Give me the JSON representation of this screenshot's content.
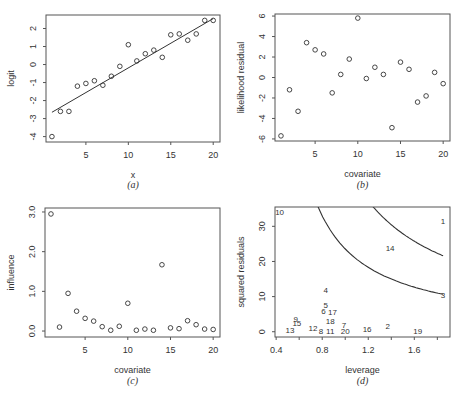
{
  "chart_data": [
    {
      "panel": "a",
      "type": "scatter",
      "caption": "(a)",
      "xlabel": "x",
      "ylabel": "logit",
      "xlim": [
        0.3,
        20.8
      ],
      "ylim": [
        -4.3,
        2.75
      ],
      "xticks": [
        5,
        10,
        15,
        20
      ],
      "yticks": [
        -4,
        -3,
        -2,
        -1,
        0,
        1,
        2
      ],
      "grid": false,
      "x": [
        1,
        2,
        3,
        4,
        5,
        6,
        7,
        8,
        9,
        10,
        11,
        12,
        13,
        14,
        15,
        16,
        17,
        18,
        19,
        20
      ],
      "y": [
        -4.0,
        -2.6,
        -2.6,
        -1.2,
        -1.05,
        -0.9,
        -1.15,
        -0.65,
        -0.1,
        1.1,
        0.2,
        0.6,
        0.8,
        0.4,
        1.65,
        1.7,
        1.35,
        1.7,
        2.45,
        2.45
      ],
      "fit_line": {
        "x": [
          1,
          20
        ],
        "y": [
          -2.65,
          2.55
        ]
      }
    },
    {
      "panel": "b",
      "type": "scatter",
      "caption": "(b)",
      "xlabel": "covariate",
      "ylabel": "likelihood residual",
      "xlim": [
        0.3,
        20.8
      ],
      "ylim": [
        -6.2,
        6.2
      ],
      "xticks": [
        5,
        10,
        15,
        20
      ],
      "yticks": [
        -6,
        -4,
        -2,
        0,
        2,
        4,
        6
      ],
      "grid": false,
      "x": [
        1,
        2,
        3,
        4,
        5,
        6,
        7,
        8,
        9,
        10,
        11,
        12,
        13,
        14,
        15,
        16,
        17,
        18,
        19,
        20
      ],
      "y": [
        -5.7,
        -1.2,
        -3.3,
        3.4,
        2.7,
        2.3,
        -1.5,
        0.3,
        1.8,
        5.8,
        -0.1,
        1.0,
        0.3,
        -4.9,
        1.5,
        0.8,
        -2.4,
        -1.8,
        0.5,
        -0.6
      ]
    },
    {
      "panel": "c",
      "type": "scatter",
      "caption": "(c)",
      "xlabel": "covariate",
      "ylabel": "influence",
      "xlim": [
        0.3,
        20.8
      ],
      "ylim": [
        -0.15,
        3.1
      ],
      "xticks": [
        5,
        10,
        15,
        20
      ],
      "yticks": [
        0.0,
        1.0,
        2.0,
        3.0
      ],
      "yticklabels": [
        "0.0",
        "1.0",
        "2.0",
        "3.0"
      ],
      "grid": false,
      "x": [
        1,
        2,
        3,
        4,
        5,
        6,
        7,
        8,
        9,
        10,
        11,
        12,
        13,
        14,
        15,
        16,
        17,
        18,
        19,
        20
      ],
      "y": [
        2.95,
        0.1,
        0.95,
        0.5,
        0.32,
        0.25,
        0.11,
        0.02,
        0.12,
        0.7,
        0.02,
        0.05,
        0.02,
        1.67,
        0.08,
        0.06,
        0.26,
        0.16,
        0.05,
        0.04
      ]
    },
    {
      "panel": "d",
      "type": "scatter",
      "caption": "(d)",
      "xlabel": "leverage",
      "ylabel": "squared residuals",
      "xlim": [
        0.39,
        1.91
      ],
      "ylim": [
        -1.5,
        35.5
      ],
      "xticks": [
        0.4,
        0.6,
        0.8,
        1.0,
        1.2,
        1.4,
        1.6,
        1.8
      ],
      "xticklabels": [
        "0.4",
        "",
        "0.8",
        "",
        "1.2",
        "",
        "1.6",
        ""
      ],
      "yticks": [
        0,
        10,
        20,
        30
      ],
      "grid": false,
      "markers": "numeric labels",
      "labels": [
        "1",
        "2",
        "3",
        "4",
        "5",
        "6",
        "7",
        "8",
        "9",
        "10",
        "11",
        "12",
        "13",
        "14",
        "15",
        "16",
        "17",
        "18",
        "19",
        "20"
      ],
      "x": [
        1.85,
        1.37,
        1.85,
        0.83,
        0.83,
        0.81,
        0.99,
        0.79,
        0.57,
        0.43,
        0.87,
        0.72,
        0.52,
        1.39,
        0.58,
        1.19,
        0.89,
        0.87,
        1.63,
        1.0
      ],
      "y": [
        31.5,
        1.5,
        10.5,
        11.8,
        7.5,
        5.9,
        2.0,
        0.2,
        3.7,
        34.2,
        0.2,
        1.2,
        0.4,
        23.8,
        2.5,
        0.8,
        5.6,
        3.1,
        0.3,
        0.3
      ],
      "contours": [
        {
          "name": "lower",
          "a": 0.3,
          "c": 16.5,
          "x_range": [
            0.57,
            1.85
          ]
        },
        {
          "name": "upper",
          "a": 0.3,
          "c": 33.5,
          "x_range": [
            1.14,
            1.85
          ]
        }
      ]
    }
  ],
  "figure": {
    "captions": [
      "(a)",
      "(b)",
      "(c)",
      "(d)"
    ]
  }
}
